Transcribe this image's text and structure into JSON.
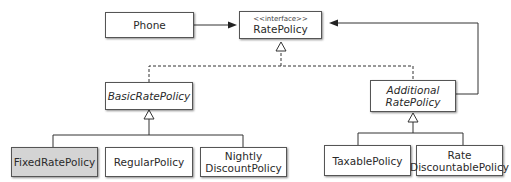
{
  "diagram": {
    "type": "UML class diagram",
    "classes": {
      "phone": {
        "label": "Phone"
      },
      "rate_policy": {
        "stereotype": "<<interface>>",
        "label": "RatePolicy"
      },
      "basic_rate_policy": {
        "label": "BasicRatePolicy",
        "abstract": true
      },
      "additional_rate_policy": {
        "line1": "Additional",
        "line2": "RatePolicy",
        "abstract": true
      },
      "fixed_rate_policy": {
        "label": "FixedRatePolicy",
        "highlighted": true
      },
      "regular_policy": {
        "label": "RegularPolicy"
      },
      "nightly_discount_policy": {
        "line1": "Nightly",
        "line2": "DiscountPolicy"
      },
      "taxable_policy": {
        "label": "TaxablePolicy"
      },
      "rate_discountable_policy": {
        "line1": "Rate",
        "line2": "DiscountablePolicy"
      }
    },
    "relationships": [
      {
        "from": "Phone",
        "to": "RatePolicy",
        "type": "association"
      },
      {
        "from": "BasicRatePolicy",
        "to": "RatePolicy",
        "type": "realization"
      },
      {
        "from": "AdditionalRatePolicy",
        "to": "RatePolicy",
        "type": "realization"
      },
      {
        "from": "AdditionalRatePolicy",
        "to": "RatePolicy",
        "type": "association"
      },
      {
        "from": "FixedRatePolicy",
        "to": "BasicRatePolicy",
        "type": "generalization"
      },
      {
        "from": "RegularPolicy",
        "to": "BasicRatePolicy",
        "type": "generalization"
      },
      {
        "from": "NightlyDiscountPolicy",
        "to": "BasicRatePolicy",
        "type": "generalization"
      },
      {
        "from": "TaxablePolicy",
        "to": "AdditionalRatePolicy",
        "type": "generalization"
      },
      {
        "from": "RateDiscountablePolicy",
        "to": "AdditionalRatePolicy",
        "type": "generalization"
      }
    ],
    "colors": {
      "line": "#333333",
      "highlight": "#d4d4d4"
    }
  }
}
